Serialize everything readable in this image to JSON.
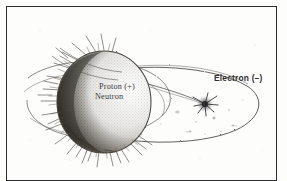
{
  "figure": {
    "kind": "scanned-line-drawing",
    "background_color": "#fdfdfc",
    "ink_color": "#3a3a3c",
    "border": {
      "name": "figure-border",
      "color": "#2b2b2e",
      "style": "solid-thin-rectangle"
    },
    "labels": {
      "proton": "Proton (+)",
      "neutron": "Neutron",
      "electron": "Electron (–)"
    },
    "parts": {
      "nucleus": "nucleus-sphere",
      "nucleus_shading": "stippled-crescent-shading",
      "orbit": "electron-orbit-ellipse",
      "secondary_orbit": "secondary-orbit-ellipse",
      "electron": "electron-particle",
      "electron_glow": "electron-starburst",
      "leader_line": "electron-leader-line",
      "radiating_spikes": "nucleus-radiating-spikes",
      "speckles": "orbit-speckle-field"
    }
  }
}
